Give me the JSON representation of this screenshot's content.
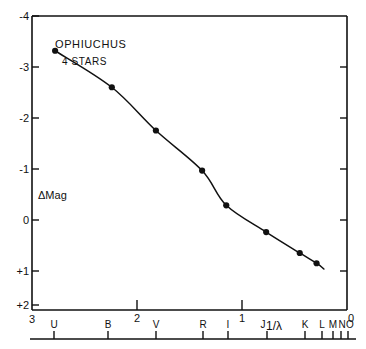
{
  "chart_data": {
    "type": "line",
    "title": "OPHIUCHUS",
    "subtitle": "4 STARS",
    "xlabel": "1/λ",
    "ylabel": "ΔMag",
    "xlim": [
      3.0,
      0.0
    ],
    "ylim": [
      2.6,
      -4.0
    ],
    "grid": false,
    "legend": "none",
    "x_axis_ticks": [
      "3",
      "2",
      "1",
      "0"
    ],
    "x_axis_tick_values": [
      3,
      2,
      1,
      0
    ],
    "y_axis_ticks": [
      "-4",
      "-3",
      "-2",
      "-1",
      "0",
      "+1",
      "+2"
    ],
    "y_axis_tick_values": [
      -4,
      -3,
      -2,
      -1,
      0,
      1,
      2
    ],
    "band_labels": [
      "U",
      "B",
      "V",
      "R",
      "I",
      "",
      "J",
      "K",
      "L",
      "M",
      "N",
      "O"
    ],
    "band_x_values": [
      2.78,
      2.24,
      1.82,
      1.38,
      1.15,
      0.85,
      0.77,
      0.45,
      0.29,
      0.2,
      0.12,
      0.06
    ],
    "categories": [
      "U",
      "B",
      "V",
      "R",
      "I",
      "J",
      "K",
      "L"
    ],
    "x": [
      2.78,
      2.24,
      1.82,
      1.38,
      1.15,
      0.77,
      0.45,
      0.29
    ],
    "values": [
      1.82,
      1.0,
      0.03,
      -0.87,
      -1.65,
      -2.25,
      -2.72,
      -2.95
    ],
    "annotations": [
      {
        "text": "OPHIUCHUS",
        "x": 2.53,
        "y": -3.35
      },
      {
        "text": "4 STARS",
        "x": 2.47,
        "y": -3.02
      },
      {
        "text": "ΔMag",
        "x": 2.83,
        "y": -0.42
      },
      {
        "text": "1/λ",
        "x": 0.73,
        "y": 2.85
      }
    ]
  },
  "figure": {
    "title": "OPHIUCHUS",
    "subtitle": "4 STARS",
    "y_label": "ΔMag",
    "x_label": "1/λ",
    "axis_color": "#111111",
    "line_color": "#111111",
    "marker_color": "#111111",
    "background": "#ffffff"
  }
}
